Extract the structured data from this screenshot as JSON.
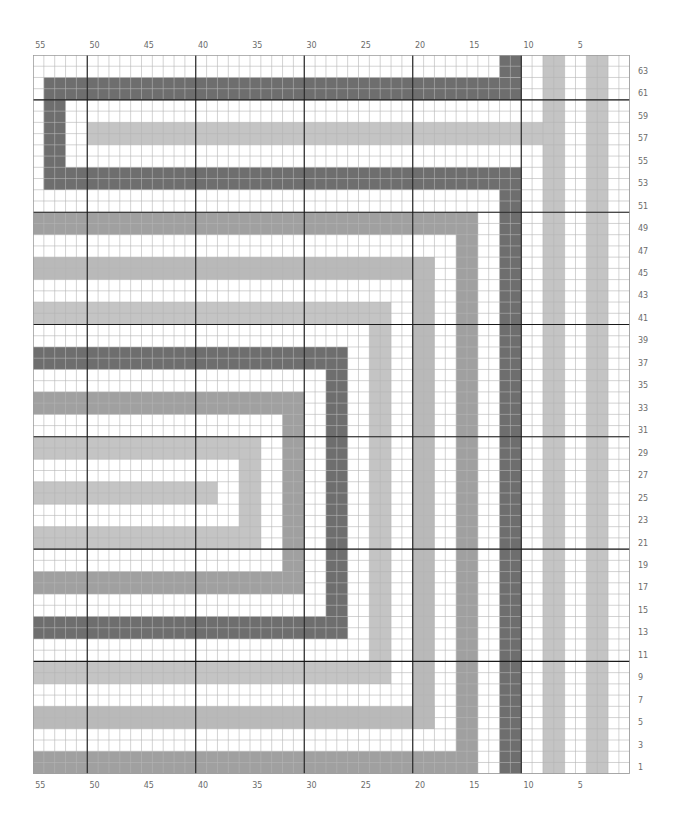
{
  "chart": {
    "columns": 55,
    "rows": 64,
    "column_numbering": "right-to-left",
    "row_numbering": "bottom-to-top",
    "thick_line_every": 10,
    "colors": {
      "background": "#ffffff",
      "dark": "#6e6e6e",
      "medium": "#a0a0a0",
      "light": "#c4c4c4",
      "light2": "#b9b9b9",
      "grid_thin": "#b5b5b5",
      "grid_thick": "#1a1a1a",
      "label": "#6a6a6a"
    },
    "top_column_labels": [
      "55",
      "50",
      "45",
      "40",
      "35",
      "30",
      "25",
      "20",
      "15",
      "10",
      "5"
    ],
    "bottom_column_labels": [
      "55",
      "50",
      "45",
      "40",
      "35",
      "30",
      "25",
      "20",
      "15",
      "10",
      "5"
    ],
    "right_row_labels": [
      "63",
      "61",
      "59",
      "57",
      "55",
      "53",
      "51",
      "49",
      "47",
      "45",
      "43",
      "41",
      "39",
      "37",
      "35",
      "33",
      "31",
      "29",
      "27",
      "25",
      "23",
      "21",
      "19",
      "17",
      "15",
      "13",
      "11",
      "9",
      "7",
      "5",
      "3",
      "1"
    ]
  },
  "chart_data": {
    "type": "heatmap",
    "title": "",
    "xlabel": "Stitch (column)",
    "ylabel": "Row",
    "x_range": [
      55,
      1
    ],
    "y_range": [
      1,
      64
    ],
    "x_ticks": [
      55,
      50,
      45,
      40,
      35,
      30,
      25,
      20,
      15,
      10,
      5
    ],
    "y_ticks": [
      1,
      3,
      5,
      7,
      9,
      11,
      13,
      15,
      17,
      19,
      21,
      23,
      25,
      27,
      29,
      31,
      33,
      35,
      37,
      39,
      41,
      43,
      45,
      47,
      49,
      51,
      53,
      55,
      57,
      59,
      61,
      63
    ],
    "grid": true,
    "legend": [],
    "cells_default": "white",
    "blocks": [
      {
        "color": "dark",
        "cols": [
          12,
          11
        ],
        "rows": [
          63,
          64
        ]
      },
      {
        "color": "dark",
        "cols": [
          54,
          11
        ],
        "rows": [
          61,
          62
        ]
      },
      {
        "color": "dark",
        "cols": [
          54,
          53
        ],
        "rows": [
          53,
          60
        ]
      },
      {
        "color": "dark",
        "cols": [
          54,
          11
        ],
        "rows": [
          53,
          54
        ]
      },
      {
        "color": "dark",
        "cols": [
          12,
          11
        ],
        "rows": [
          1,
          54
        ]
      },
      {
        "color": "light",
        "cols": [
          50,
          9
        ],
        "rows": [
          57,
          58
        ]
      },
      {
        "color": "light",
        "cols": [
          8,
          7
        ],
        "rows": [
          1,
          64
        ]
      },
      {
        "color": "light",
        "cols": [
          4,
          3
        ],
        "rows": [
          1,
          64
        ]
      },
      {
        "color": "medium",
        "cols": [
          55,
          15
        ],
        "rows": [
          49,
          50
        ]
      },
      {
        "color": "medium",
        "cols": [
          16,
          15
        ],
        "rows": [
          1,
          50
        ]
      },
      {
        "color": "medium",
        "cols": [
          55,
          15
        ],
        "rows": [
          1,
          2
        ]
      },
      {
        "color": "light2",
        "cols": [
          55,
          19
        ],
        "rows": [
          45,
          46
        ]
      },
      {
        "color": "light2",
        "cols": [
          20,
          19
        ],
        "rows": [
          5,
          46
        ]
      },
      {
        "color": "light2",
        "cols": [
          55,
          19
        ],
        "rows": [
          5,
          6
        ]
      },
      {
        "color": "light",
        "cols": [
          55,
          23
        ],
        "rows": [
          41,
          42
        ]
      },
      {
        "color": "light",
        "cols": [
          24,
          23
        ],
        "rows": [
          9,
          42
        ]
      },
      {
        "color": "light",
        "cols": [
          55,
          23
        ],
        "rows": [
          9,
          10
        ]
      },
      {
        "color": "dark",
        "cols": [
          55,
          27
        ],
        "rows": [
          37,
          38
        ]
      },
      {
        "color": "dark",
        "cols": [
          28,
          27
        ],
        "rows": [
          13,
          38
        ]
      },
      {
        "color": "dark",
        "cols": [
          55,
          27
        ],
        "rows": [
          13,
          14
        ]
      },
      {
        "color": "medium",
        "cols": [
          55,
          31
        ],
        "rows": [
          33,
          34
        ]
      },
      {
        "color": "medium",
        "cols": [
          32,
          31
        ],
        "rows": [
          17,
          34
        ]
      },
      {
        "color": "medium",
        "cols": [
          55,
          31
        ],
        "rows": [
          17,
          18
        ]
      },
      {
        "color": "light",
        "cols": [
          55,
          35
        ],
        "rows": [
          29,
          30
        ]
      },
      {
        "color": "light",
        "cols": [
          36,
          35
        ],
        "rows": [
          21,
          30
        ]
      },
      {
        "color": "light",
        "cols": [
          55,
          35
        ],
        "rows": [
          21,
          22
        ]
      },
      {
        "color": "light",
        "cols": [
          55,
          39
        ],
        "rows": [
          25,
          26
        ]
      }
    ]
  }
}
